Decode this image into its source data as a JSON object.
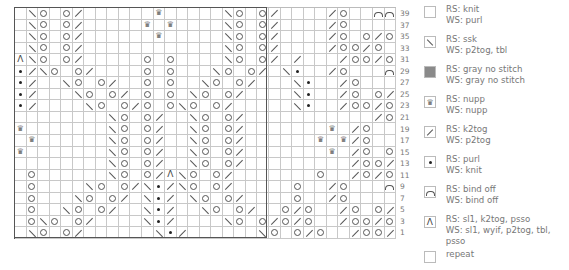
{
  "chart": {
    "columns": 33,
    "repeat_columns": 22,
    "rows": [
      ".\\O.O/......N.....\\O.O/..../O..CCC",
      ".\\O.O/.....N.N....\\O.O/..../O.....",
      ".\\O.O/......N.....\\O.O/..../O.O/O.",
      ".\\O.O/............\\O.O/..../OO/O.G",
      "A\\O.O/.....O.O....\\O.O/./.../OO/O.GG",
      "*/\\O.O/....O.O...\\O.O/.\\*../O...CCC",
      "*/..\\O.O/..O.O..\\O.O/...\\*../O.....",
      "*/...\\O.O/.O.O.\\O.O/....\\*../O.O/O.",
      "*/....\\O.O/O.O\\O.O/.....\\*../OO/O.G",
      "........\\O.O/..\\O.O/.........../O.O/O.GG",
      "N.......\\O.O/..\\O.O/.......N./O...CCC",
      ".N......\\O.O/..\\O.O/......N.N/O.....",
      "N.......\\O.O/..\\O.O/.......N./O.O/O.",
      "........\\O.O/..\\O.O/........./OO/O.G",
      ".O......\\O.O/A\\O.O/.......O../O/O.GG",
      ".O....\\O.O/\\*/\\O.O/.....O../O...CCC",
      ".O...\\O.O/.\\*/.\\O.O/....O../O.....",
      ".O..\\O.O/..\\*/..\\O.O/..O/O../O.O/O.",
      ".O\\O.O/....\\*/....\\O.O/O/O../OO/O.G",
      ".\\O.O/......\\*/......\\O.O/O../OO/..GG"
    ],
    "row_labels": [
      "39",
      "37",
      "35",
      "33",
      "31",
      "29",
      "27",
      "25",
      "23",
      "21",
      "19",
      "17",
      "15",
      "13",
      "11",
      "9",
      "7",
      "5",
      "3",
      "1"
    ]
  },
  "legend": [
    {
      "symbol": "knit",
      "rs": "RS: knit",
      "ws": "WS: purl"
    },
    {
      "symbol": "ssk",
      "rs": "RS: ssk",
      "ws": "WS: p2tog, tbl"
    },
    {
      "symbol": "gray",
      "rs": "RS: gray no stitch",
      "ws": "WS: gray no stitch"
    },
    {
      "symbol": "nupp",
      "rs": "RS: nupp",
      "ws": "WS: nupp"
    },
    {
      "symbol": "k2tog",
      "rs": "RS: k2tog",
      "ws": "WS: p2tog"
    },
    {
      "symbol": "purl",
      "rs": "RS: purl",
      "ws": "WS: knit"
    },
    {
      "symbol": "bindoff",
      "rs": "RS: bind off",
      "ws": "WS: bind off"
    },
    {
      "symbol": "cdd",
      "rs": "RS: sl1, k2tog, psso",
      "ws": "WS: sl1, wyif, p2tog, tbl, psso"
    },
    {
      "symbol": "repeat",
      "rs": "repeat",
      "ws": ""
    }
  ],
  "icons": {
    "nupp": "♛",
    "cdd": "Λ"
  },
  "colors": {
    "gray": "#8a8a8a",
    "line": "#555555",
    "text": "#777777"
  }
}
